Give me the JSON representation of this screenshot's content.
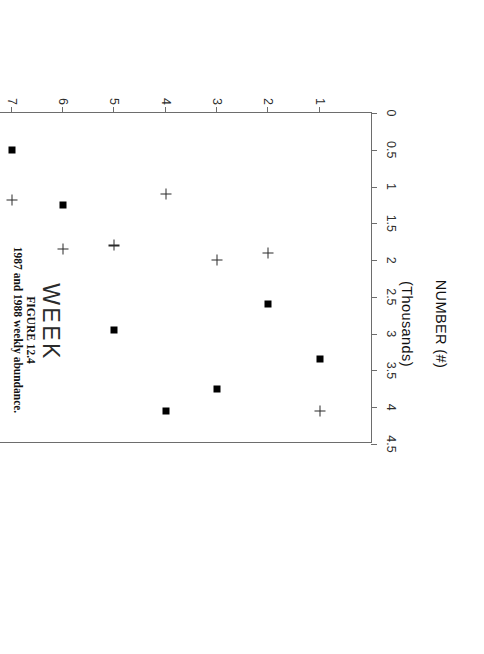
{
  "figure": {
    "caption_label": "FIGURE 12.4",
    "caption_text": "1987 and 1988 weekly abundance."
  },
  "chart_data": {
    "type": "scatter",
    "title": "",
    "orientation": "rotated-90-clockwise",
    "xlabel": "WEEK",
    "ylabel_line1": "NUMBER (#)",
    "ylabel_line2": "(Thousands)",
    "x": [
      1,
      2,
      3,
      4,
      5,
      6,
      7,
      8,
      9
    ],
    "xlim": [
      0,
      10
    ],
    "xticks": [
      "1",
      "2",
      "3",
      "4",
      "5",
      "6",
      "7",
      "8",
      "9"
    ],
    "ylim": [
      0,
      4.5
    ],
    "yticks": [
      "0",
      "0.5",
      "1",
      "1.5",
      "2",
      "2.5",
      "3",
      "3.5",
      "4",
      "4.5"
    ],
    "ytick_values": [
      0,
      0.5,
      1,
      1.5,
      2,
      2.5,
      3,
      3.5,
      4,
      4.5
    ],
    "grid": false,
    "legend_position": "bottom-right",
    "series": [
      {
        "name": "1987",
        "marker": "filled-square",
        "values": [
          3.35,
          2.6,
          3.75,
          4.05,
          2.95,
          1.25,
          0.5,
          0.45,
          0.22
        ]
      },
      {
        "name": "1988",
        "marker": "plus",
        "values": [
          4.05,
          1.9,
          2.0,
          1.1,
          1.8,
          1.85,
          1.18,
          1.47,
          0.6
        ]
      }
    ]
  },
  "legend": {
    "entries": [
      {
        "label": "1987",
        "marker": "filled-square"
      },
      {
        "label": "1988",
        "marker": "plus"
      }
    ]
  }
}
